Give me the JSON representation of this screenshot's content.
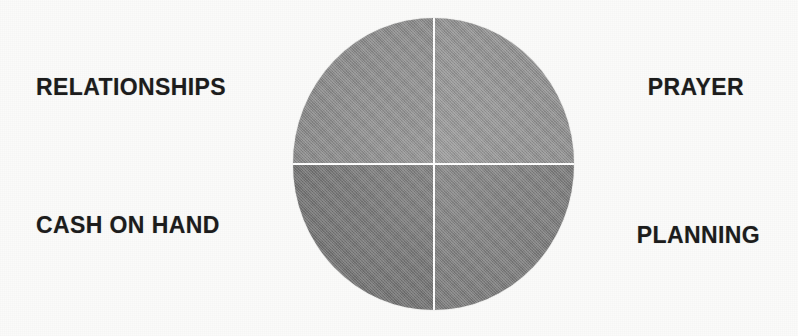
{
  "diagram": {
    "type": "four-quadrant-circle",
    "shape": "circle",
    "divider_color": "#ffffff",
    "background_color": "#fbfbfa",
    "label_color": "#1d1d1d",
    "quadrants": [
      {
        "id": "top-left",
        "label": "RELATIONSHIPS",
        "label_position": "outside-left-upper",
        "fill": "#8e8e8e"
      },
      {
        "id": "top-right",
        "label": "PRAYER",
        "label_position": "outside-right-upper",
        "fill": "#959595"
      },
      {
        "id": "bottom-left",
        "label": "CASH ON HAND",
        "label_position": "outside-left-lower",
        "fill": "#787878"
      },
      {
        "id": "bottom-right",
        "label": "PLANNING",
        "label_position": "outside-right-lower",
        "fill": "#818181"
      }
    ]
  }
}
